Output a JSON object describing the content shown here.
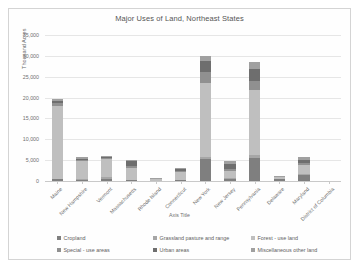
{
  "chart": {
    "title": "Major Uses of Land, Northeast States",
    "xaxis_title": "Axis Title",
    "yaxis_title": "Thousand Acres"
  },
  "chart_data": {
    "type": "bar",
    "stacked": true,
    "title": "Major Uses of Land, Northeast States",
    "xlabel": "Axis Title",
    "ylabel": "Thousand Acres",
    "ylim": [
      0,
      35000
    ],
    "yticks": [
      0,
      5000,
      10000,
      15000,
      20000,
      25000,
      30000,
      35000
    ],
    "ytick_labels": [
      "0",
      "5,000",
      "10,000",
      "15,000",
      "20,000",
      "25,000",
      "30,000",
      "35,000"
    ],
    "grid": true,
    "legend_position": "bottom",
    "categories": [
      "Maine",
      "New Hampshire",
      "Vermont",
      "Massachusetts",
      "Rhode Island",
      "Connecticut",
      "New York",
      "New Jersey",
      "Pennsylvania",
      "Delaware",
      "Maryland",
      "District of Columbia"
    ],
    "series": [
      {
        "name": "Cropland",
        "color": "#7f7f7f",
        "values": [
          500,
          300,
          600,
          250,
          20,
          200,
          5200,
          600,
          5600,
          500,
          1500,
          0
        ]
      },
      {
        "name": "Grassland pasture and range",
        "color": "#a6a6a6",
        "values": [
          50,
          100,
          400,
          50,
          5,
          50,
          600,
          100,
          700,
          40,
          150,
          0
        ]
      },
      {
        "name": "Forest - use land",
        "color": "#bfbfbf",
        "values": [
          17500,
          4300,
          4300,
          2900,
          350,
          1800,
          17800,
          1700,
          15500,
          350,
          2300,
          0
        ]
      },
      {
        "name": "Special - use areas",
        "color": "#909090",
        "values": [
          700,
          300,
          250,
          400,
          40,
          250,
          2500,
          500,
          2200,
          60,
          400,
          20
        ]
      },
      {
        "name": "Urban areas",
        "color": "#6e6e6e",
        "values": [
          400,
          300,
          200,
          1100,
          150,
          600,
          2600,
          1300,
          2800,
          120,
          700,
          30
        ]
      },
      {
        "name": "Miscellaneous other land",
        "color": "#a0a0a0",
        "values": [
          600,
          400,
          200,
          400,
          60,
          200,
          1300,
          600,
          1800,
          180,
          750,
          10
        ]
      }
    ]
  }
}
